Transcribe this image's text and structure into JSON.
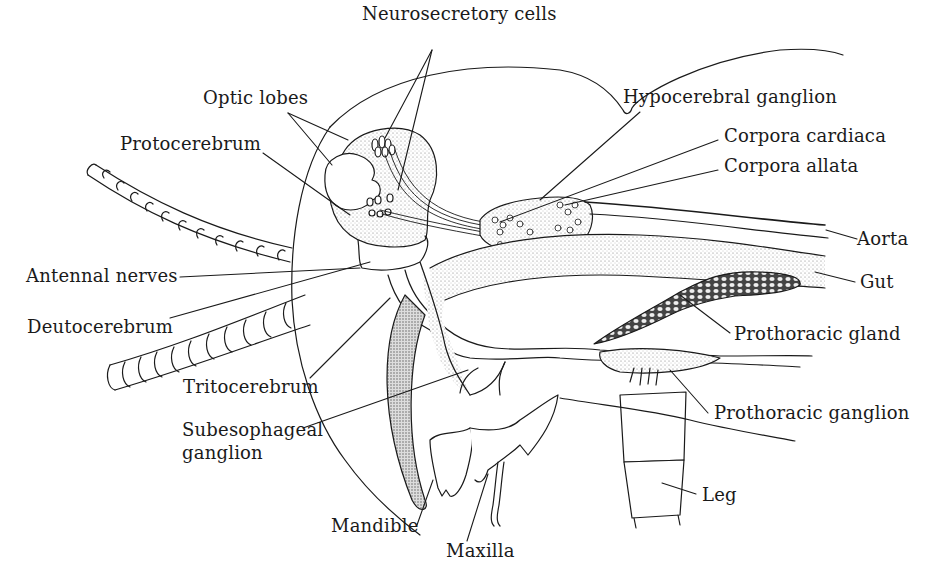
{
  "diagram": {
    "type": "anatomical-illustration",
    "colors": {
      "ink": "#1a1a1a",
      "background": "#ffffff",
      "stipple": "#8a8a8a"
    },
    "labels": {
      "neurosecretory_cells": "Neurosecretory cells",
      "optic_lobes": "Optic lobes",
      "protocerebrum": "Protocerebrum",
      "hypocerebral_ganglion": "Hypocerebral ganglion",
      "corpora_cardiaca": "Corpora cardiaca",
      "corpora_allata": "Corpora allata",
      "aorta": "Aorta",
      "gut": "Gut",
      "antennal_nerves": "Antennal nerves",
      "deutocerebrum": "Deutocerebrum",
      "prothoracic_gland": "Prothoracic gland",
      "tritocerebrum": "Tritocerebrum",
      "subesophageal_ganglion": "Subesophageal ganglion",
      "prothoracic_ganglion": "Prothoracic ganglion",
      "leg": "Leg",
      "mandible": "Mandible",
      "maxilla": "Maxilla"
    }
  }
}
